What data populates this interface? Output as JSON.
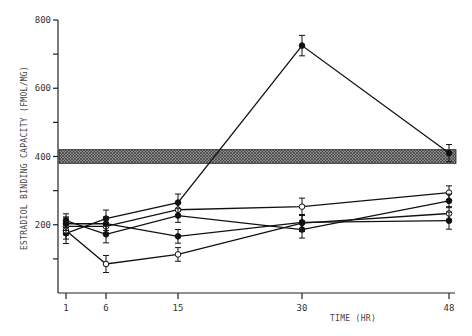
{
  "chart_data": {
    "type": "line",
    "title": "",
    "xlabel": "TIME (HR)",
    "ylabel": "ESTRADIOL BINDING CAPACITY (FMOL/MG)",
    "x": [
      1,
      6,
      15,
      30,
      48
    ],
    "x_tick_labels": [
      "1",
      "6",
      "15",
      "30",
      "48"
    ],
    "ylim": [
      0,
      800
    ],
    "y_ticks": [
      100,
      200,
      300,
      400,
      500,
      600,
      700,
      800
    ],
    "y_tick_labels": [
      "200",
      "400",
      "600",
      "800"
    ],
    "y_labeled_ticks": [
      200,
      400,
      600,
      800
    ],
    "grid": false,
    "reference_band": {
      "low": 380,
      "high": 420,
      "style": "hatched"
    },
    "series": [
      {
        "name": "series-1",
        "marker": "filled-circle",
        "values": [
          175,
          218,
          265,
          725,
          410
        ],
        "error": [
          30,
          25,
          25,
          30,
          25
        ]
      },
      {
        "name": "series-2",
        "marker": "open-circle",
        "values": [
          183,
          85,
          113,
          205,
          233
        ],
        "error": [
          25,
          25,
          20,
          25,
          20
        ]
      },
      {
        "name": "series-3",
        "marker": "open-circle",
        "values": [
          195,
          195,
          244,
          253,
          294
        ],
        "error": [
          25,
          20,
          20,
          25,
          20
        ]
      },
      {
        "name": "series-4",
        "marker": "filled-circle",
        "values": [
          212,
          172,
          227,
          186,
          270
        ],
        "error": [
          20,
          25,
          20,
          25,
          20
        ]
      },
      {
        "name": "series-5",
        "marker": "filled-circle",
        "values": [
          203,
          203,
          166,
          207,
          212
        ],
        "error": [
          20,
          20,
          20,
          20,
          25
        ]
      }
    ]
  }
}
